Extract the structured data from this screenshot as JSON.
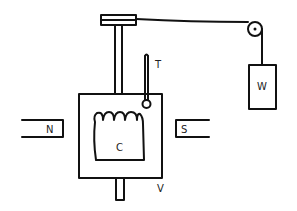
{
  "diagram": {
    "labels": {
      "thermometer": "T",
      "weight": "W",
      "north_pole": "N",
      "south_pole": "S",
      "coil": "C",
      "vessel": "V"
    },
    "colors": {
      "ink": "#111111",
      "background": "#ffffff"
    }
  }
}
